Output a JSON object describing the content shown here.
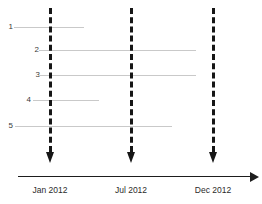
{
  "figure": {
    "type": "timeline-gantt",
    "background_color": "#ffffff",
    "bar_color": "#c9c9c9",
    "marker_color": "#161616",
    "axis_color": "#1d1d1d",
    "label_color": "#2b2b2b"
  },
  "tasks": [
    {
      "label": "1",
      "start_px": 14,
      "end_px": 84,
      "y_px": 27
    },
    {
      "label": "2",
      "label_x": 31,
      "start_px": 39,
      "end_px": 196,
      "y_px": 50
    },
    {
      "label": "3",
      "label_x": 32,
      "start_px": 39,
      "end_px": 196,
      "y_px": 75
    },
    {
      "label": "4",
      "label_x": 23,
      "start_px": 33,
      "end_px": 99,
      "y_px": 100
    },
    {
      "label": "5",
      "label_x": 5,
      "start_px": 15,
      "end_px": 172,
      "y_px": 126
    }
  ],
  "markers": [
    {
      "label": "Jan 2012",
      "x_px": 49,
      "top_px": 8,
      "arrow_y_px": 152
    },
    {
      "label": "Jul 2012",
      "x_px": 130,
      "top_px": 8,
      "arrow_y_px": 152
    },
    {
      "label": "Dec 2012",
      "x_px": 212,
      "top_px": 8,
      "arrow_y_px": 152
    }
  ],
  "axis": {
    "start_px": 18,
    "end_px": 250,
    "y_px": 176,
    "tick_label_y_px": 185,
    "arrow_direction": "right"
  }
}
